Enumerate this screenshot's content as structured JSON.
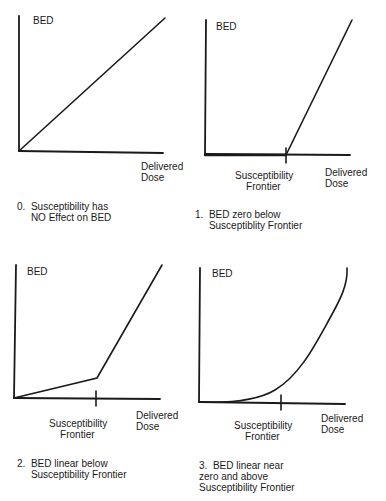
{
  "panels": [
    {
      "id": 0,
      "y_label": "BED",
      "x_label": "Delivered\nDose",
      "frontier_label": "",
      "caption": "0.  Susceptibility has\n     NO Effect on BED",
      "curve": "linear through origin"
    },
    {
      "id": 1,
      "y_label": "BED",
      "x_label": "Delivered\nDose",
      "frontier_label": "Susceptibility\n    Frontier",
      "caption": "1.  BED zero below\n     Susceptiblity Frontier",
      "curve": "zero until frontier, then linear"
    },
    {
      "id": 2,
      "y_label": "BED",
      "x_label": "Delivered\nDose",
      "frontier_label": "Susceptibility\n    Frontier",
      "caption": "2.  BED linear below\n     Susceptibility Frontier",
      "curve": "shallow linear until frontier, then steep linear"
    },
    {
      "id": 3,
      "y_label": "BED",
      "x_label": "Delivered\nDose",
      "frontier_label": "Susceptibility\n    Frontier",
      "caption": "3.  BED linear near\nzero and above\nSusceptibility Frontier",
      "curve": "smooth curve near zero, rising around frontier"
    }
  ],
  "colors": {
    "ink": "#1a1a1a",
    "background": "#ffffff"
  }
}
